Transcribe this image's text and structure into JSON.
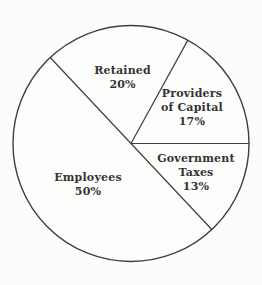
{
  "page": {
    "background": "#fcfcfa"
  },
  "chart_data": {
    "type": "pie",
    "title": "",
    "slices": [
      {
        "label": "Providers of Capital",
        "label_lines": [
          "Providers",
          "of Capital"
        ],
        "value": 17,
        "value_label": "17%"
      },
      {
        "label": "Retained",
        "label_lines": [
          "Retained"
        ],
        "value": 20,
        "value_label": "20%"
      },
      {
        "label": "Employees",
        "label_lines": [
          "Employees"
        ],
        "value": 50,
        "value_label": "50%"
      },
      {
        "label": "Government Taxes",
        "label_lines": [
          "Government",
          "Taxes"
        ],
        "value": 13,
        "value_label": "13%"
      }
    ],
    "start_angle_deg": 0,
    "direction": "counterclockwise",
    "slice_fill": "#fdfdfc",
    "stroke_color": "#3e3e3e",
    "text_color": "#343434",
    "legend": "none",
    "style": "outline-only pie, white unfilled slices, labels inside slices"
  }
}
